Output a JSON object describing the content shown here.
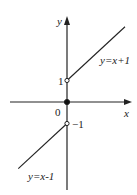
{
  "chart_data": {
    "type": "line",
    "title": "",
    "xlabel": "x",
    "ylabel": "y",
    "origin_label": "0",
    "xlim": [
      -2.6,
      2.7
    ],
    "ylim": [
      -3.3,
      3.7
    ],
    "series": [
      {
        "name": "y=x+1",
        "label": "y=x+1",
        "domain": "x>0",
        "x": [
          0,
          2.5
        ],
        "y": [
          1,
          3.5
        ],
        "start_open": true
      },
      {
        "name": "y=x-1",
        "label": "y=x-1",
        "domain": "x<0",
        "x": [
          -2.1,
          0
        ],
        "y": [
          -3.1,
          -1
        ],
        "end_open": true
      }
    ],
    "points": [
      {
        "name": "origin",
        "x": 0,
        "y": 0,
        "style": "filled"
      },
      {
        "name": "open-point-upper",
        "x": 0,
        "y": 1,
        "style": "open",
        "label": "1"
      },
      {
        "name": "open-point-lower",
        "x": 0,
        "y": -1,
        "style": "open",
        "label": "−1"
      }
    ]
  }
}
